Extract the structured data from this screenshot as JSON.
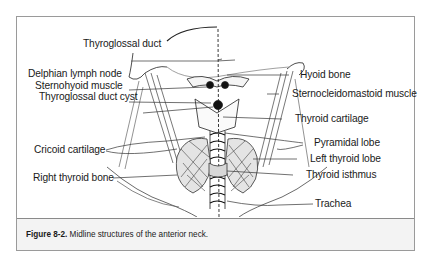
{
  "figure": {
    "number": "Figure 8-2.",
    "caption": " Midline structures of the anterior neck."
  },
  "labels": {
    "left": [
      {
        "text": "Thyroglossal duct",
        "x": 131,
        "y": 37
      },
      {
        "text": "Delphian lymph node",
        "x": 11,
        "y": 67
      },
      {
        "text": "Sternohyoid muscle",
        "x": 18,
        "y": 79
      },
      {
        "text": "Thyroglossal duct cyst",
        "x": 22,
        "y": 90
      },
      {
        "text": "Cricoid cartilage",
        "x": 17,
        "y": 127
      },
      {
        "text": "Right thyroid bone",
        "x": 16,
        "y": 155
      }
    ],
    "right": [
      {
        "text": "Hyoid bone",
        "x": 283,
        "y": 52
      },
      {
        "text": "Sternocleidomastoid muscle",
        "x": 275,
        "y": 71
      },
      {
        "text": "Thyroid cartilage",
        "x": 278,
        "y": 96
      },
      {
        "text": "Pyramidal lobe",
        "x": 297,
        "y": 120
      },
      {
        "text": "Left thyroid lobe",
        "x": 293,
        "y": 136
      },
      {
        "text": "Thyroid isthmus",
        "x": 289,
        "y": 152
      },
      {
        "text": "Trachea",
        "x": 305,
        "y": 181
      }
    ]
  }
}
